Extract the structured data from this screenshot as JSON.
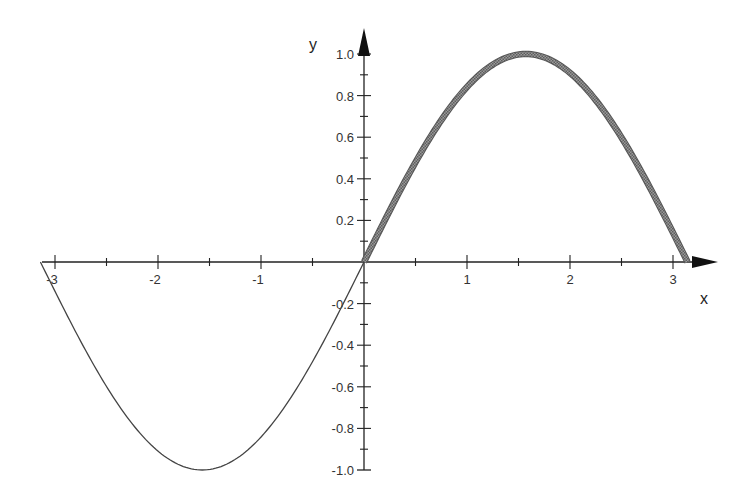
{
  "chart_data": {
    "type": "line",
    "title": "",
    "xlabel": "x",
    "ylabel": "y",
    "xlim": [
      -3.14159,
      3.14159
    ],
    "ylim": [
      -1.0,
      1.0
    ],
    "grid": false,
    "legend": null,
    "x_ticks": [
      -3,
      -2,
      -1,
      1,
      2,
      3
    ],
    "x_tick_labels": [
      "-3",
      "-2",
      "-1",
      "1",
      "2",
      "3"
    ],
    "y_ticks": [
      -1.0,
      -0.8,
      -0.6,
      -0.4,
      -0.2,
      0.2,
      0.4,
      0.6,
      0.8,
      1.0
    ],
    "y_tick_labels": [
      "-1.0",
      "-0.8",
      "-0.6",
      "-0.4",
      "-0.2",
      "0.2",
      "0.4",
      "0.6",
      "0.8",
      "1.0"
    ],
    "series": [
      {
        "name": "sin(x), -π ≤ x ≤ 0",
        "style": "thin",
        "color": "#444444",
        "x": [
          -3.1416,
          -2.618,
          -2.0944,
          -1.5708,
          -1.0472,
          -0.5236,
          0
        ],
        "y": [
          0,
          -0.5,
          -0.866,
          -1.0,
          -0.866,
          -0.5,
          0
        ]
      },
      {
        "name": "sin(x), 0 ≤ x ≤ π",
        "style": "thick-hatched",
        "color": "#888888",
        "x": [
          0,
          0.5236,
          1.0472,
          1.5708,
          2.0944,
          2.618,
          3.1416
        ],
        "y": [
          0,
          0.5,
          0.866,
          1.0,
          0.866,
          0.5,
          0
        ]
      }
    ],
    "annotations": []
  },
  "layout": {
    "origin_px": [
      364,
      262
    ],
    "x_scale_px": 103,
    "y_scale_px": 208,
    "x_axis_start_px": 42,
    "x_axis_end_px": 718,
    "y_axis_top_px": 28,
    "y_axis_bottom_px": 470
  },
  "colors": {
    "axis": "#222222",
    "thin_curve": "#444444",
    "thick_curve": "#8a8a8a",
    "thick_curve_edge": "#555555",
    "text": "#333333"
  }
}
